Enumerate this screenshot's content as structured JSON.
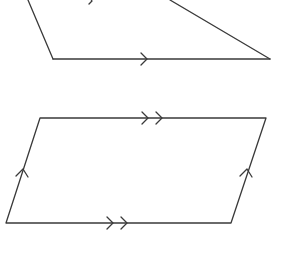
{
  "diagram": {
    "background": "#ffffff",
    "stroke_color": "#3a3a3a",
    "shapes": [
      {
        "name": "upper-quadrilateral",
        "type": "trapezoid-partial",
        "edges": [
          {
            "name": "left-edge",
            "from": [
              28,
              0
            ],
            "to": [
              53,
              59
            ]
          },
          {
            "name": "bottom-edge",
            "from": [
              53,
              59
            ],
            "to": [
              270,
              59
            ],
            "parallel_mark": "single-arrow",
            "mark_at": [
              145,
              59
            ]
          },
          {
            "name": "right-edge",
            "from": [
              170,
              0
            ],
            "to": [
              270,
              59
            ]
          }
        ],
        "partial_mark": {
          "at": [
            92,
            0
          ],
          "type": "single-arrow-cropped"
        }
      },
      {
        "name": "parallelogram",
        "type": "parallelogram",
        "vertices": [
          [
            40,
            118
          ],
          [
            266,
            118
          ],
          [
            231,
            223
          ],
          [
            6,
            223
          ]
        ],
        "edges": [
          {
            "name": "top-edge",
            "parallel_mark": "double-arrow",
            "mark_at": [
              150,
              118
            ]
          },
          {
            "name": "bottom-edge",
            "parallel_mark": "double-arrow",
            "mark_at": [
              115,
              223
            ]
          },
          {
            "name": "left-edge",
            "parallel_mark": "single-arrow",
            "mark_at": [
              22,
              172
            ]
          },
          {
            "name": "right-edge",
            "parallel_mark": "single-arrow",
            "mark_at": [
              247,
              172
            ]
          }
        ]
      }
    ]
  }
}
